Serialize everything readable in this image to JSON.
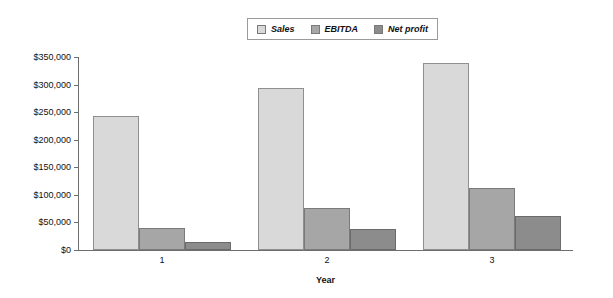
{
  "chart_data": {
    "type": "bar",
    "title": "",
    "subtitle": "",
    "xlabel": "Year",
    "ylabel": "",
    "categories": [
      "1",
      "2",
      "3"
    ],
    "series": [
      {
        "name": "Sales",
        "values": [
          243000,
          293000,
          340000
        ],
        "color": "#d9d9d9"
      },
      {
        "name": "EBITDA",
        "values": [
          40000,
          77000,
          112000
        ],
        "color": "#a6a6a6"
      },
      {
        "name": "Net profit",
        "values": [
          15000,
          38000,
          62000
        ],
        "color": "#8c8c8c"
      }
    ],
    "ylim": [
      0,
      350000
    ],
    "ytick_values": [
      0,
      50000,
      100000,
      150000,
      200000,
      250000,
      300000,
      350000
    ],
    "ytick_labels": [
      "$0",
      "$50,000",
      "$100,000",
      "$150,000",
      "$200,000",
      "$250,000",
      "$300,000",
      "$350,000"
    ],
    "grid": false,
    "legend_position": "top-center",
    "legend_entries": [
      "Sales",
      "EBITDA",
      "Net profit"
    ],
    "annotations": []
  }
}
